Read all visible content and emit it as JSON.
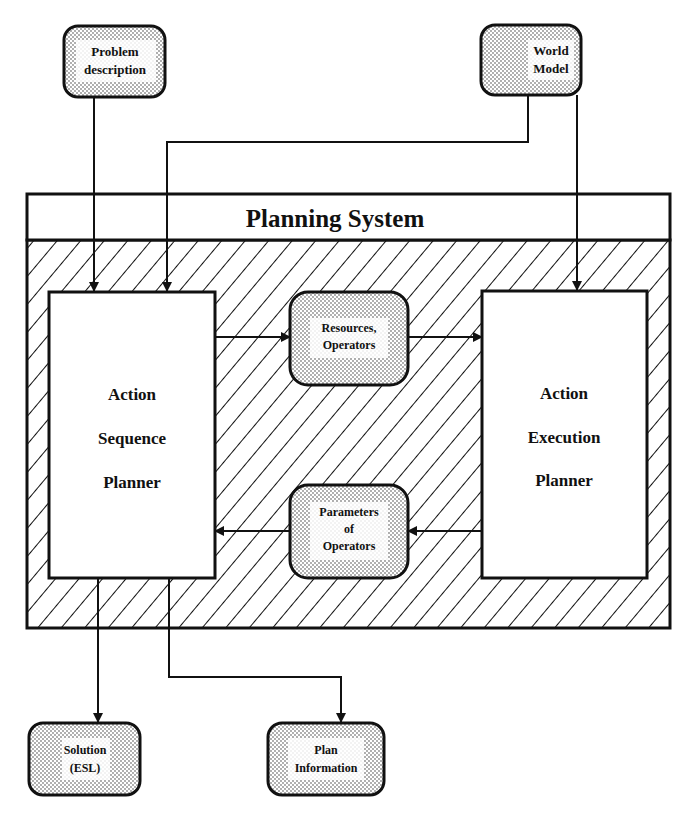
{
  "diagram": {
    "title": "Planning System",
    "colors": {
      "line": "#111111",
      "background": "#ffffff",
      "stipple": "#9a9a9a",
      "hatch": "#111111"
    },
    "inputs": {
      "problem_description": {
        "line1": "Problem",
        "line2": "description"
      },
      "world_model": {
        "line1": "World",
        "line2": "Model"
      }
    },
    "planners": {
      "sequence": {
        "line1": "Action",
        "line2": "Sequence",
        "line3": "Planner"
      },
      "execution": {
        "line1": "Action",
        "line2": "Execution",
        "line3": "Planner"
      }
    },
    "exchange": {
      "resources": {
        "line1": "Resources,",
        "line2": "Operators"
      },
      "parameters": {
        "line1": "Parameters",
        "line2": "of",
        "line3": "Operators"
      }
    },
    "outputs": {
      "solution": {
        "line1": "Solution",
        "line2": "(ESL)"
      },
      "plan_information": {
        "line1": "Plan",
        "line2": "Information"
      }
    }
  }
}
